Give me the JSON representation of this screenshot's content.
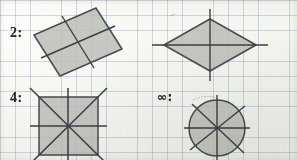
{
  "worksheet": {
    "title": "Lines of symmetry worksheet",
    "medium": "pencil on graph paper",
    "paper": {
      "background_color": "#fbfbf9",
      "grid_color": "#8190a0",
      "grid_spacing_px": 15
    },
    "ink": {
      "outline_color": "#4a4a52",
      "fill_color": "#bdbdb8",
      "symmetry_line_color": "#3d3d46",
      "label_color": "#2b2b2e"
    }
  },
  "labels": [
    {
      "id": "label-2",
      "text": "2:",
      "meaning": "two lines of symmetry",
      "x": 10,
      "y": 25
    },
    {
      "id": "label-4",
      "text": "4:",
      "meaning": "four lines of symmetry",
      "x": 10,
      "y": 90
    },
    {
      "id": "label-infinity",
      "text": "∞:",
      "meaning": "infinitely many lines of symmetry",
      "x": 157,
      "y": 90
    }
  ],
  "figures": [
    {
      "id": "rectangle-tilted",
      "name": "Tilted rectangle",
      "shape": "rectangle",
      "label_ref": "label-2",
      "symmetry_lines": 2,
      "filled": true,
      "vertices": [
        [
          34,
          35
        ],
        [
          96,
          8
        ],
        [
          122,
          49
        ],
        [
          60,
          76
        ]
      ],
      "symmetry_segments": [
        [
          [
            47,
            55
          ],
          [
            109,
            28
          ]
        ],
        [
          [
            65,
            21
          ],
          [
            91,
            63
          ]
        ]
      ],
      "overhang_px": 8
    },
    {
      "id": "rhombus",
      "name": "Rhombus",
      "shape": "rhombus",
      "label_ref": "label-2",
      "symmetry_lines": 2,
      "filled": true,
      "vertices": [
        [
          210,
          19
        ],
        [
          256,
          45
        ],
        [
          210,
          71
        ],
        [
          164,
          45
        ]
      ],
      "symmetry_segments": [
        [
          [
            154,
            45
          ],
          [
            266,
            45
          ]
        ],
        [
          [
            210,
            10
          ],
          [
            210,
            80
          ]
        ]
      ],
      "overhang_px": 10
    },
    {
      "id": "square",
      "name": "Square",
      "shape": "square",
      "label_ref": "label-4",
      "symmetry_lines": 4,
      "filled": true,
      "vertices": [
        [
          39,
          97
        ],
        [
          98,
          97
        ],
        [
          98,
          155
        ],
        [
          39,
          155
        ]
      ],
      "symmetry_segments": [
        [
          [
            31,
            126
          ],
          [
            106,
            126
          ]
        ],
        [
          [
            68,
            89
          ],
          [
            68,
            160
          ]
        ],
        [
          [
            31,
            89
          ],
          [
            106,
            163
          ]
        ],
        [
          [
            106,
            89
          ],
          [
            31,
            163
          ]
        ]
      ],
      "overhang_px": 8
    },
    {
      "id": "circle",
      "name": "Circle",
      "shape": "circle",
      "label_ref": "label-infinity",
      "symmetry_lines": "infinite",
      "filled": true,
      "center": [
        217,
        128
      ],
      "radius": 28,
      "symmetry_segments": [
        [
          [
            186,
            128
          ],
          [
            248,
            128
          ]
        ],
        [
          [
            217,
            97
          ],
          [
            217,
            160
          ]
        ],
        [
          [
            193,
            148
          ],
          [
            241,
            108
          ]
        ],
        [
          [
            194,
            106
          ],
          [
            240,
            150
          ]
        ]
      ],
      "overhang_px": 6,
      "annotation": "faint dotted arc sketched at upper-left of circle"
    }
  ],
  "stray_marks": [
    {
      "id": "pencil-smudge-top",
      "x": 172,
      "y": 15,
      "note": "faint pencil tick above rhombus"
    },
    {
      "id": "dotted-arc-circle",
      "x": 195,
      "y": 95,
      "note": "small dotted arc near circle top-left"
    }
  ]
}
